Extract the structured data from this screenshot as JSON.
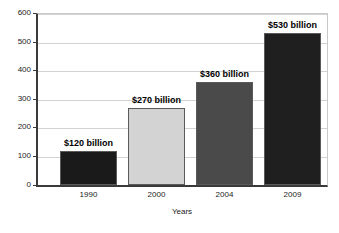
{
  "chart_data": {
    "type": "bar",
    "title": "",
    "subtitle": "",
    "categories": [
      "1990",
      "2000",
      "2004",
      "2009"
    ],
    "values": [
      120,
      270,
      360,
      530
    ],
    "data_labels": [
      "$120 billion",
      "$270 billion",
      "$360 billion",
      "$530 billion"
    ],
    "xlabel": "Years",
    "ylabel": "",
    "ylim": [
      0,
      600
    ],
    "ytick_labels": [
      "0",
      "100",
      "200",
      "300",
      "400",
      "500",
      "600"
    ],
    "ytick_values": [
      0,
      100,
      200,
      300,
      400,
      500,
      600
    ],
    "grid": true,
    "legend": false,
    "legend_position": "none",
    "bar_colors": [
      "#1a1a1a",
      "#d3d3d3",
      "#4a4a4a",
      "#1f1f1f"
    ],
    "bar_border_color": "#5a5a5a",
    "gridline_color": "#d2d2d2",
    "axis_color": "#3a3a3a",
    "frame_color": "#c9c9c9",
    "background_color": "#ffffff",
    "text_color": "#1b1b1b"
  }
}
